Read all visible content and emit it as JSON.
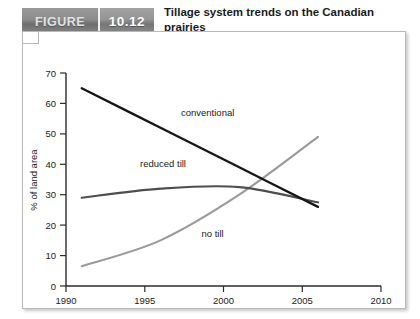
{
  "figure": {
    "tab_label": "FIGURE",
    "number": "10.12",
    "title": "Tillage system trends on the Canadian prairies"
  },
  "chart_data": {
    "type": "line",
    "title": "Tillage system trends on the Canadian prairies",
    "xlabel": "",
    "ylabel": "% of land area",
    "xlim": [
      1990,
      2010
    ],
    "ylim": [
      0,
      70
    ],
    "xticks": [
      1990,
      1995,
      2000,
      2005,
      2010
    ],
    "yticks": [
      0,
      10,
      20,
      30,
      40,
      50,
      60,
      70
    ],
    "grid": false,
    "legend": "inline-labels",
    "series": [
      {
        "name": "conventional",
        "color": "#161616",
        "label_x": 1997.3,
        "label_y": 56,
        "x": [
          1991,
          1996,
          2001,
          2006
        ],
        "y": [
          65,
          52,
          39,
          26
        ]
      },
      {
        "name": "reduced till",
        "color": "#4e4e4e",
        "label_x": 1994.7,
        "label_y": 39,
        "x": [
          1991,
          1996,
          2001,
          2006
        ],
        "y": [
          29,
          32,
          32.5,
          27.5
        ]
      },
      {
        "name": "no till",
        "color": "#9a9a9a",
        "label_x": 1998.6,
        "label_y": 16,
        "x": [
          1991,
          1996,
          2001,
          2006
        ],
        "y": [
          6.5,
          15,
          30,
          49
        ]
      }
    ]
  },
  "axis": {
    "y_label": "% of land area",
    "y_ticks": [
      "0",
      "10",
      "20",
      "30",
      "40",
      "50",
      "60",
      "70"
    ],
    "x_ticks": [
      "1990",
      "1995",
      "2000",
      "2005",
      "2010"
    ]
  },
  "labels": {
    "conventional": "conventional",
    "reduced_till": "reduced till",
    "no_till": "no till"
  },
  "colors": {
    "conventional": "#161616",
    "reduced_till": "#4e4e4e",
    "no_till": "#9a9a9a",
    "axis": "#2b2b2b",
    "tab_gray": "#8c8c8c"
  }
}
